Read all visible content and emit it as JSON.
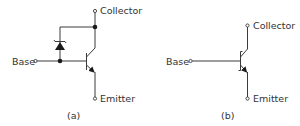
{
  "figure": {
    "panels": [
      {
        "id": "a",
        "caption": "(a)",
        "labels": {
          "collector": "Collector",
          "base": "Base",
          "emitter": "Emitter"
        },
        "components": [
          "npn-transistor",
          "zener-diode",
          "junction-dot",
          "junction-dot"
        ]
      },
      {
        "id": "b",
        "caption": "(b)",
        "labels": {
          "collector": "Collector",
          "base": "Base",
          "emitter": "Emitter"
        },
        "components": [
          "schottky-transistor"
        ]
      }
    ]
  },
  "colors": {
    "line": "#3a3a3a",
    "text": "#333333",
    "background": "#ffffff"
  }
}
